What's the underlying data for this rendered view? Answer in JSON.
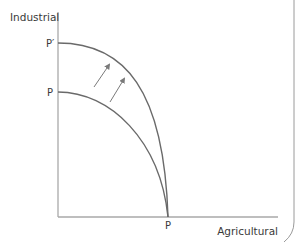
{
  "diagram": {
    "type": "production-possibility-frontier",
    "y_axis_label": "Industrial",
    "x_axis_label": "Agricultural",
    "labels": {
      "outer_frontier_y": "P′",
      "inner_frontier_y": "P",
      "common_intercept_x": "P"
    },
    "curves": [
      {
        "name": "inner-frontier-PP",
        "y_intercept_label": "P",
        "x_intercept_label": "P"
      },
      {
        "name": "outer-frontier-P'P",
        "y_intercept_label": "P′",
        "x_intercept_label": "P"
      }
    ],
    "arrows": [
      {
        "name": "shift-arrow-1",
        "direction": "up-right"
      },
      {
        "name": "shift-arrow-2",
        "direction": "up-right"
      }
    ],
    "colors": {
      "axis": "#a9a9a9",
      "curve": "#6a6a6a",
      "arrow": "#7a7a7a",
      "text": "#3a3a3a",
      "border": "#9a9a9a"
    }
  }
}
